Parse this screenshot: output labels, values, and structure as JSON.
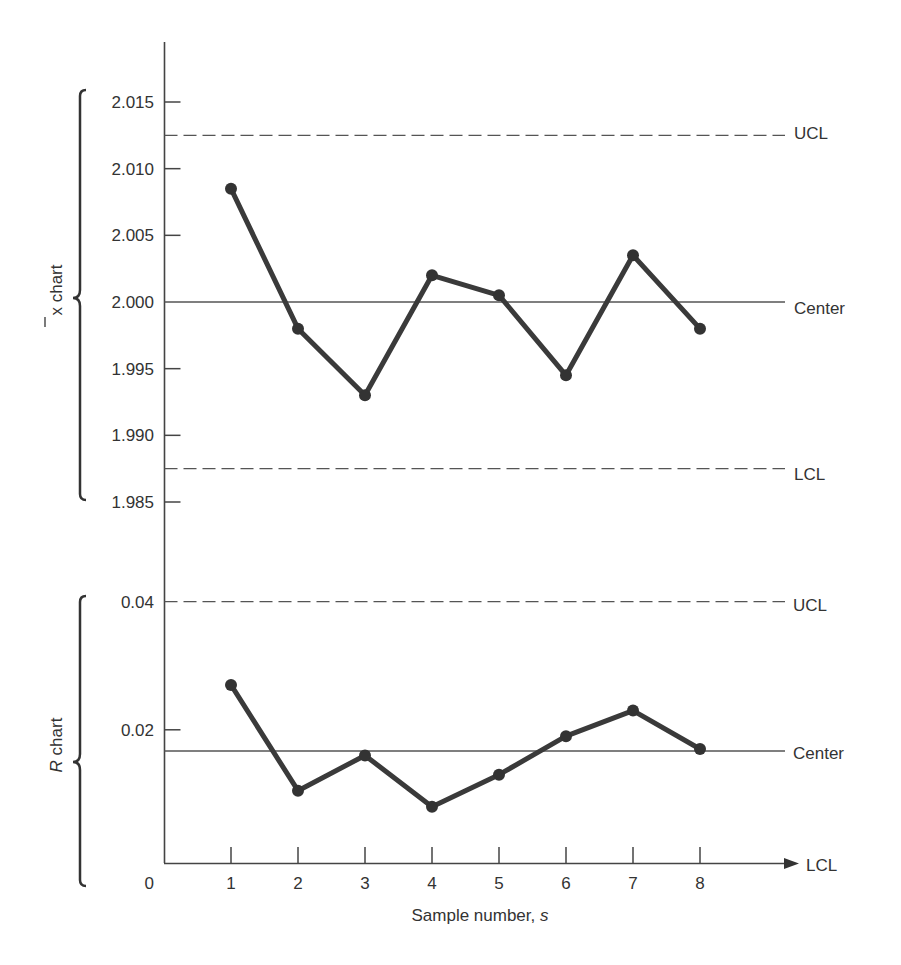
{
  "chart_data": [
    {
      "type": "line",
      "title": "x̄ chart",
      "ylabel": "x̄ chart",
      "xlabel": "Sample number, s",
      "x": [
        1,
        2,
        3,
        4,
        5,
        6,
        7,
        8
      ],
      "series": [
        {
          "name": "Sample mean",
          "values": [
            2.0085,
            1.998,
            1.993,
            2.002,
            2.0005,
            1.9945,
            2.0035,
            1.998
          ]
        }
      ],
      "yticks": [
        2.015,
        2.01,
        2.005,
        2.0,
        1.995,
        1.99,
        1.985
      ],
      "ytick_labels": [
        "2.015",
        "2.010",
        "2.005",
        "2.000",
        "1.995",
        "1.990",
        "1.985"
      ],
      "ylim": [
        1.985,
        2.015
      ],
      "reference_lines": [
        {
          "label": "UCL",
          "value": 2.0125,
          "style": "dashed"
        },
        {
          "label": "Center",
          "value": 2.0,
          "style": "solid"
        },
        {
          "label": "LCL",
          "value": 1.9875,
          "style": "dashed"
        }
      ],
      "grid": false
    },
    {
      "type": "line",
      "title": "R chart",
      "ylabel": "R chart",
      "xlabel": "Sample number, s",
      "x": [
        1,
        2,
        3,
        4,
        5,
        6,
        7,
        8
      ],
      "series": [
        {
          "name": "Sample range",
          "values": [
            0.027,
            0.0105,
            0.016,
            0.008,
            0.013,
            0.019,
            0.023,
            0.017
          ]
        }
      ],
      "yticks": [
        0.04,
        0.02,
        0
      ],
      "ytick_labels": [
        "0.04",
        "0.02",
        "0"
      ],
      "ylim": [
        0,
        0.04
      ],
      "reference_lines": [
        {
          "label": "UCL",
          "value": 0.04,
          "style": "dashed"
        },
        {
          "label": "Center",
          "value": 0.0167,
          "style": "solid"
        },
        {
          "label": "LCL",
          "value": 0,
          "style": "axis-arrow"
        }
      ],
      "xticks": [
        1,
        2,
        3,
        4,
        5,
        6,
        7,
        8
      ],
      "xtick_labels": [
        "1",
        "2",
        "3",
        "4",
        "5",
        "6",
        "7",
        "8"
      ],
      "grid": false
    }
  ],
  "labels": {
    "xbar_chart": "x chart",
    "xbar_symbol": "x",
    "xbar_rest": " chart",
    "r_symbol": "R",
    "r_rest": " chart",
    "ucl": "UCL",
    "center": "Center",
    "lcl": "LCL",
    "x_axis_title_main": "Sample number, ",
    "x_axis_title_var": "s",
    "origin": "0"
  },
  "colors": {
    "ink": "#333333",
    "line": "#3a3a3a",
    "ref_line": "#555555"
  }
}
